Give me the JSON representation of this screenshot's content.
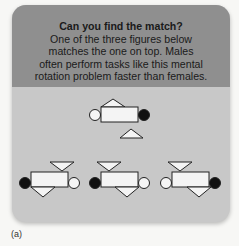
{
  "card": {
    "title": "Can you find the match?",
    "body_lines": [
      "One of the three figures below",
      "matches the one on top. Males",
      "often perform tasks like this mental",
      "rotation problem faster than females."
    ],
    "colors": {
      "header_bg": "#8f8f8f",
      "body_bg": "#c8c8c8",
      "shape_fill": "#f4f4f4",
      "filled_circle": "#111111"
    }
  },
  "figures": {
    "target": {
      "left_circle": "white",
      "right_circle": "black",
      "top_triangle": "up-left",
      "bottom_triangle": "up-right"
    },
    "options": [
      {
        "left_circle": "black",
        "right_circle": "white",
        "top_triangle": "down-right",
        "bottom_triangle": "down-left"
      },
      {
        "left_circle": "black",
        "right_circle": "white",
        "top_triangle": "down-left",
        "bottom_triangle": "down-right"
      },
      {
        "left_circle": "white",
        "right_circle": "black",
        "top_triangle": "down-left",
        "bottom_triangle": "down-right"
      }
    ]
  },
  "caption": "(a)"
}
